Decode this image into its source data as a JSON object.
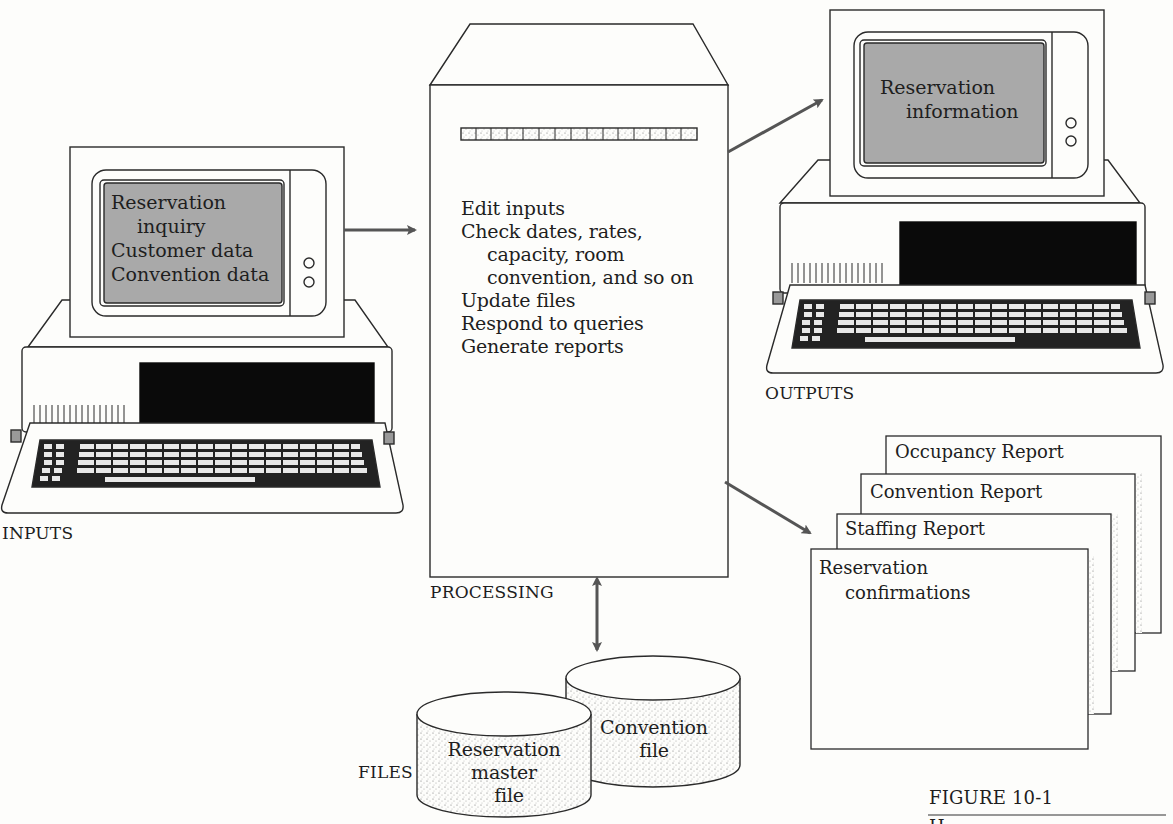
{
  "figure": {
    "caption": "FIGURE 10-1",
    "caption_cut_text": "H"
  },
  "inputs": {
    "label": "INPUTS",
    "screen_lines": [
      "Reservation",
      "inquiry",
      "Customer data",
      "Convention data"
    ]
  },
  "processing": {
    "label": "PROCESSING",
    "steps": [
      "Edit inputs",
      "Check dates, rates,",
      "capacity, room",
      "convention, and so on",
      "Update files",
      "Respond to queries",
      "Generate reports"
    ]
  },
  "outputs": {
    "label": "OUTPUTS",
    "screen_lines": [
      "Reservation",
      "information"
    ],
    "reports": [
      "Occupancy Report",
      "Convention Report",
      "Staffing Report",
      "Reservation",
      "confirmations"
    ]
  },
  "files": {
    "label": "FILES",
    "items": [
      {
        "lines": [
          "Convention",
          "file"
        ]
      },
      {
        "lines": [
          "Reservation",
          "master",
          "file"
        ]
      }
    ]
  },
  "colors": {
    "line": "#2a2a2a",
    "arrow": "#555555",
    "screen": "#a9a9a9",
    "drive": "#0a0a0a",
    "paper": "#fdfdfb"
  }
}
